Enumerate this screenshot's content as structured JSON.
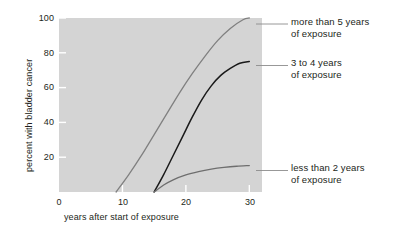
{
  "chart_data": {
    "type": "line",
    "title": "",
    "xlabel": "years after start of exposure",
    "ylabel": "percent with bladder cancer",
    "xlim": [
      0,
      32
    ],
    "ylim": [
      0,
      100
    ],
    "grid": false,
    "legend_position": "right-annotations",
    "xticks": [
      "0",
      "10",
      "20",
      "30"
    ],
    "xtick_values": [
      0,
      10,
      20,
      30
    ],
    "yticks": [
      "20",
      "40",
      "60",
      "80",
      "100"
    ],
    "ytick_values": [
      20,
      40,
      60,
      80,
      100
    ],
    "series": [
      {
        "name": "more than 5 years of exposure",
        "color": "#808080",
        "x": [
          9,
          11,
          13,
          15,
          17,
          19,
          21,
          23,
          25,
          27,
          29,
          30
        ],
        "values": [
          0,
          10,
          21,
          33,
          45,
          57,
          68,
          78,
          87,
          94,
          99,
          100
        ]
      },
      {
        "name": "3 to 4 years of exposure",
        "color": "#1a1a1a",
        "x": [
          15,
          16.5,
          18,
          19.5,
          21,
          22.5,
          24,
          25.5,
          27,
          28.5,
          30
        ],
        "values": [
          0,
          10,
          21,
          32,
          43,
          53,
          61,
          67,
          71,
          74,
          75
        ]
      },
      {
        "name": "less than 2 years of exposure",
        "color": "#6e6e6e",
        "x": [
          15,
          16.5,
          18,
          20,
          22,
          24,
          26,
          28,
          30
        ],
        "values": [
          0,
          4,
          7,
          9.8,
          11.7,
          13.1,
          14.1,
          14.8,
          15.2
        ]
      }
    ]
  },
  "annotations": [
    {
      "line1": "more than 5 years",
      "line2": "of exposure"
    },
    {
      "line1": "3 to 4 years",
      "line2": "of exposure"
    },
    {
      "line1": "less than 2 years",
      "line2": "of exposure"
    }
  ],
  "colors": {
    "plot_background": "#d4d4d4",
    "page_background": "#ffffff",
    "text": "#231f20",
    "tick": "#ffffff",
    "leader_line": "#8c8c8c"
  }
}
